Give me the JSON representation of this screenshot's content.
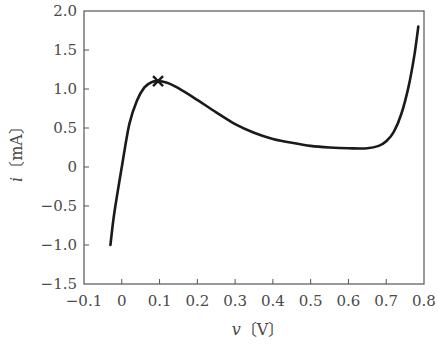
{
  "chart_data": {
    "type": "line",
    "title": "",
    "xlabel": "v〔V〕",
    "ylabel": "i〔mA〕",
    "xlabel_var": "v",
    "xlabel_unit": "〔V〕",
    "ylabel_var": "i",
    "ylabel_unit": "〔mA〕",
    "xlim": [
      -0.1,
      0.8
    ],
    "ylim": [
      -1.5,
      2.0
    ],
    "grid": false,
    "legend": null,
    "x_ticks": [
      -0.1,
      0,
      0.1,
      0.2,
      0.3,
      0.4,
      0.5,
      0.6,
      0.7,
      0.8
    ],
    "x_tick_labels": [
      "−0.1",
      "0",
      "0.1",
      "0.2",
      "0.3",
      "0.4",
      "0.5",
      "0.6",
      "0.7",
      "0.8"
    ],
    "y_ticks": [
      2.0,
      1.5,
      1.0,
      0.5,
      0,
      -0.5,
      -1.0,
      -1.5
    ],
    "y_tick_labels": [
      "2.0",
      "1.5",
      "1.0",
      "0.5",
      "0",
      "−0.5",
      "−1.0",
      "−1.5"
    ],
    "series": [
      {
        "name": "i-v characteristic",
        "color": "#1a1a1a",
        "x": [
          -0.03,
          -0.02,
          0.0,
          0.02,
          0.04,
          0.06,
          0.08,
          0.1,
          0.12,
          0.15,
          0.2,
          0.25,
          0.3,
          0.35,
          0.4,
          0.45,
          0.5,
          0.55,
          0.6,
          0.65,
          0.68,
          0.7,
          0.72,
          0.74,
          0.76,
          0.775,
          0.785
        ],
        "y": [
          -1.0,
          -0.6,
          0.0,
          0.55,
          0.85,
          1.02,
          1.09,
          1.1,
          1.08,
          1.01,
          0.86,
          0.7,
          0.55,
          0.44,
          0.36,
          0.31,
          0.27,
          0.25,
          0.24,
          0.24,
          0.27,
          0.33,
          0.45,
          0.68,
          1.05,
          1.45,
          1.8
        ]
      }
    ],
    "annotations": [
      {
        "type": "marker",
        "symbol": "x",
        "x": 0.096,
        "y": 1.1,
        "label": "peak"
      }
    ]
  },
  "colors": {
    "axis": "#555555",
    "curve": "#1a1a1a",
    "text": "#4a4a4a",
    "background": "#ffffff"
  }
}
